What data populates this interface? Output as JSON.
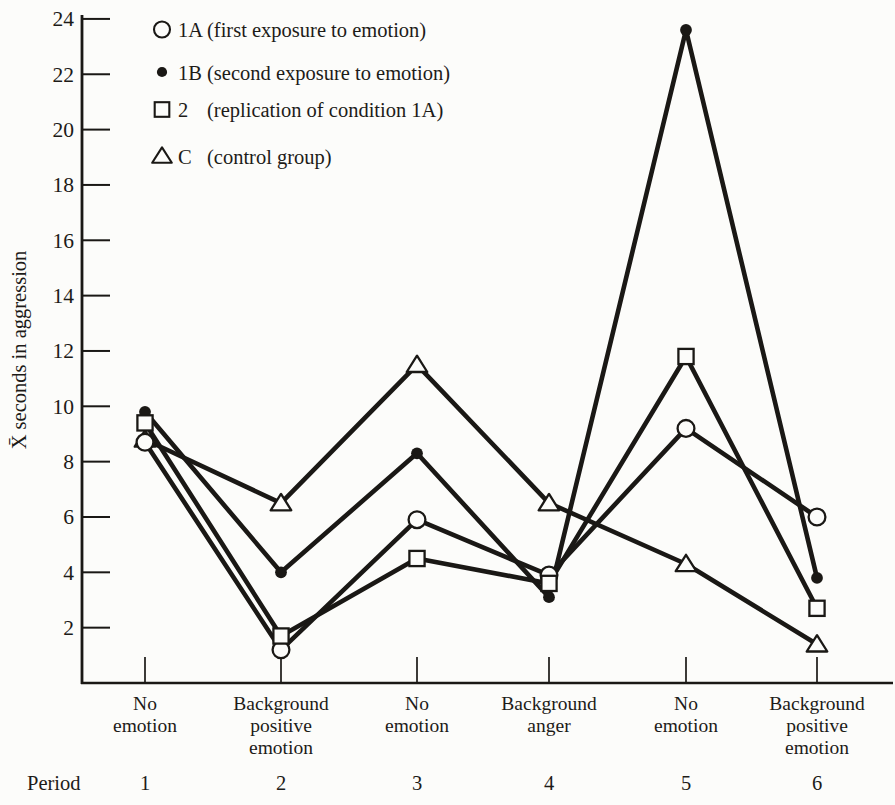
{
  "figure": {
    "paper_color": "#fcfcfa",
    "ink_color": "#1a1815"
  },
  "chart_data": {
    "type": "line",
    "title": "",
    "ylabel": "X̄ seconds in aggression",
    "xlabel": "Period",
    "ylim": [
      0,
      24
    ],
    "yticks": [
      24,
      22,
      20,
      18,
      16,
      14,
      12,
      10,
      8,
      6,
      4,
      2
    ],
    "grid": false,
    "legend_position": "top-left-inside",
    "categories": [
      1,
      2,
      3,
      4,
      5,
      6
    ],
    "category_conditions": [
      [
        "No",
        "emotion"
      ],
      [
        "Background",
        "positive",
        "emotion"
      ],
      [
        "No",
        "emotion"
      ],
      [
        "Background",
        "anger"
      ],
      [
        "No",
        "emotion"
      ],
      [
        "Background",
        "positive",
        "emotion"
      ]
    ],
    "series": [
      {
        "name": "1A",
        "marker": "open-circle",
        "legend": {
          "name": "1A",
          "desc": "(first exposure to emotion)"
        },
        "values": [
          8.7,
          1.2,
          5.9,
          3.9,
          9.2,
          6.0
        ]
      },
      {
        "name": "1B",
        "marker": "filled-circle",
        "legend": {
          "name": "1B",
          "desc": "(second exposure to emotion)"
        },
        "values": [
          9.8,
          4.0,
          8.3,
          3.1,
          23.6,
          3.8
        ]
      },
      {
        "name": "2",
        "marker": "open-square",
        "legend": {
          "name": "2",
          "desc": "(replication of condition 1A)"
        },
        "values": [
          9.4,
          1.7,
          4.5,
          3.6,
          11.8,
          2.7
        ]
      },
      {
        "name": "C",
        "marker": "open-triangle",
        "legend": {
          "name": "C",
          "desc": "(control group)"
        },
        "values": [
          8.8,
          6.5,
          11.5,
          6.5,
          4.3,
          1.4
        ]
      }
    ]
  }
}
